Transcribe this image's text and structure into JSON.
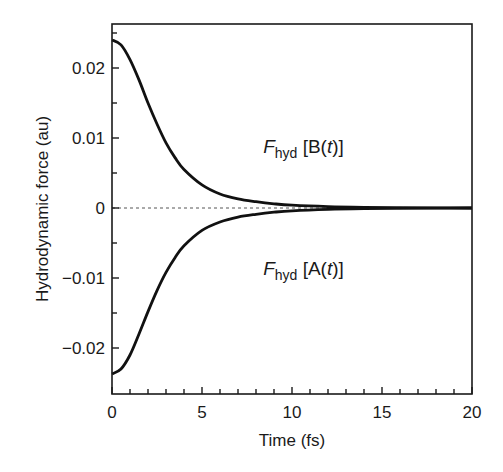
{
  "chart_data": {
    "type": "line",
    "title": "",
    "xlabel": "Time (fs)",
    "ylabel": "Hydrodynamic force (au)",
    "xlim": [
      0,
      20
    ],
    "ylim": [
      -0.025,
      0.0265
    ],
    "xticks": [
      0,
      5,
      10,
      15,
      20
    ],
    "xtick_labels": [
      "0",
      "5",
      "10",
      "15",
      "20"
    ],
    "yticks": [
      0.02,
      0.01,
      0,
      -0.01,
      -0.02
    ],
    "ytick_labels": [
      "0.02",
      "0.01",
      "0",
      "−0.01",
      "−0.02"
    ],
    "grid": false,
    "zero_line": "dashed",
    "x": [
      0,
      0.5,
      1,
      1.5,
      2,
      2.5,
      3,
      3.5,
      4,
      5,
      6,
      7,
      8,
      9,
      10,
      12,
      14,
      16,
      18,
      20
    ],
    "series": [
      {
        "name": "F_hyd [B(t)]",
        "values": [
          0.024,
          0.0233,
          0.0212,
          0.0183,
          0.015,
          0.012,
          0.0093,
          0.0072,
          0.0055,
          0.0033,
          0.002,
          0.0013,
          0.0009,
          0.0006,
          0.0004,
          0.0002,
          0.0001,
          5e-05,
          2e-05,
          0.0
        ]
      },
      {
        "name": "F_hyd [A(t)]",
        "values": [
          -0.0237,
          -0.023,
          -0.021,
          -0.018,
          -0.0148,
          -0.0118,
          -0.0092,
          -0.0071,
          -0.0054,
          -0.0032,
          -0.002,
          -0.0013,
          -0.0009,
          -0.0006,
          -0.0004,
          -0.0002,
          -0.0001,
          -5e-05,
          -2e-05,
          0.0
        ]
      }
    ],
    "annotations": [
      {
        "text_main": "F",
        "text_sub": "hyd",
        "text_rest": " [B(",
        "text_var": "t",
        "text_end": ")]",
        "x": 8.4,
        "y": 0.0078
      },
      {
        "text_main": "F",
        "text_sub": "hyd",
        "text_rest": " [A(",
        "text_var": "t",
        "text_end": ")]",
        "x": 8.4,
        "y": -0.0095
      }
    ]
  }
}
